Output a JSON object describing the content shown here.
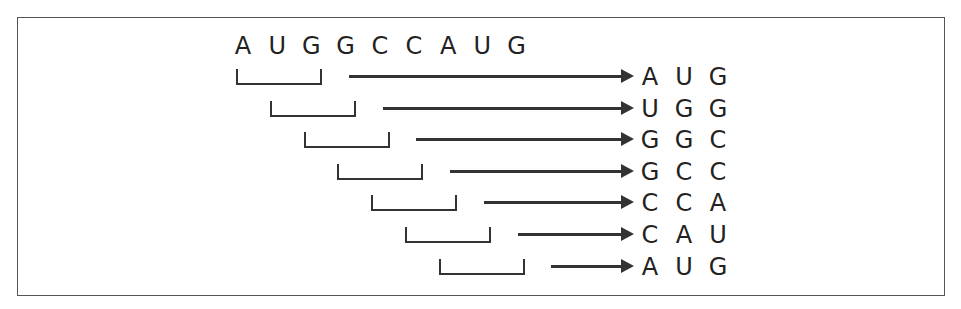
{
  "diagram": {
    "title": "",
    "sequence": [
      "A",
      "U",
      "G",
      "G",
      "C",
      "C",
      "A",
      "U",
      "G"
    ],
    "codons": [
      [
        "A",
        "U",
        "G"
      ],
      [
        "U",
        "G",
        "G"
      ],
      [
        "G",
        "G",
        "C"
      ],
      [
        "G",
        "C",
        "C"
      ],
      [
        "C",
        "C",
        "A"
      ],
      [
        "C",
        "A",
        "U"
      ],
      [
        "A",
        "U",
        "G"
      ]
    ],
    "colors": {
      "stroke": "#333333",
      "text": "#222222",
      "border": "#555555"
    }
  }
}
